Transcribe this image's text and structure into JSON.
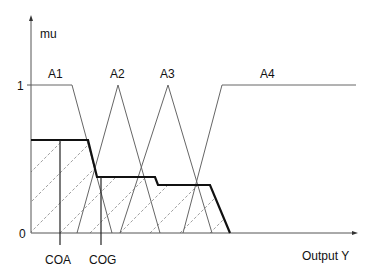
{
  "diagram": {
    "y_axis_label": "mu",
    "x_axis_label": "Output Y",
    "tick_one": "1",
    "tick_zero": "0",
    "sets": [
      {
        "label": "A1"
      },
      {
        "label": "A2"
      },
      {
        "label": "A3"
      },
      {
        "label": "A4"
      }
    ],
    "markers": [
      {
        "label": "COA"
      },
      {
        "label": "COG"
      }
    ],
    "colors": {
      "axis": "#555555",
      "membership": "#666666",
      "output": "#111111",
      "hatch": "#888888"
    }
  }
}
